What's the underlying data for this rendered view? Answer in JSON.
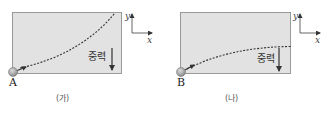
{
  "panels": [
    {
      "id": "ga",
      "caption": "(가)",
      "point_label": "A",
      "gravity_label": "중력",
      "axis": {
        "x_label": "x",
        "y_label": "y"
      },
      "trajectory": "curves upward from bottom-left to top-right (concave up)"
    },
    {
      "id": "na",
      "caption": "(나)",
      "point_label": "B",
      "gravity_label": "중력",
      "axis": {
        "x_label": "x",
        "y_label": "y"
      },
      "trajectory": "rises from bottom-left then flattens horizontally (concave down)"
    }
  ],
  "colors": {
    "box_fill": "#e2e2e2",
    "box_border": "#9a9a9a",
    "ball": "#a8a8a8",
    "line": "#333333",
    "background": "#ffffff"
  }
}
